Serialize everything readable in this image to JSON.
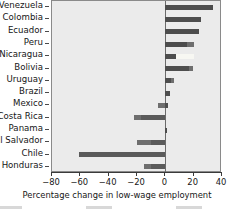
{
  "chart_data": {
    "type": "bar",
    "orientation": "horizontal",
    "title": "",
    "xlabel": "Percentage change in low-wage employment",
    "ylabel": "",
    "xlim": [
      -80,
      40
    ],
    "xticks": [
      -80,
      -60,
      -40,
      -20,
      0,
      20,
      40
    ],
    "xticklabels": [
      "−80",
      "−60",
      "−40",
      "−20",
      "0",
      "20",
      "40"
    ],
    "grid": false,
    "legend": "none",
    "categories": [
      "Venezuela",
      "Colombia",
      "Ecuador",
      "Peru",
      "Nicaragua",
      "Bolivia",
      "Uruguay",
      "Brazil",
      "Mexico",
      "Costa Rica",
      "Panama",
      "El Salvador",
      "Chile",
      "Honduras"
    ],
    "series": [
      {
        "name": "inner",
        "values": [
          33.5,
          25.0,
          24.0,
          15.5,
          7.5,
          17.0,
          4.0,
          3.0,
          2.0,
          -17.0,
          0.5,
          -10.0,
          -61.0,
          -10.0
        ]
      },
      {
        "name": "outer",
        "values": [
          33.5,
          25.0,
          24.0,
          20.5,
          20.5,
          19.5,
          6.0,
          3.0,
          -5.0,
          -22.0,
          0.5,
          -20.0,
          -61.0,
          -15.0
        ]
      }
    ],
    "values": [
      33.5,
      25.0,
      24.0,
      20.5,
      20.5,
      19.5,
      6.0,
      3.0,
      2.0,
      -22.0,
      0.5,
      -20.0,
      -61.0,
      -15.0
    ],
    "colors": {
      "bar_dark": "#4d4d4d",
      "bar_mid": "#6e6e6e",
      "bar_light": "#f7f7f2",
      "plot_background": "#ebebeb",
      "axis": "#3a3a3a",
      "text": "#161616"
    }
  }
}
